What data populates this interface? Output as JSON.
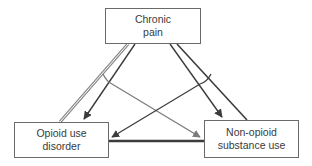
{
  "diagram": {
    "type": "triangle-relationship-diagram",
    "nodes": [
      {
        "id": "top",
        "label": "Chronic\npain"
      },
      {
        "id": "left",
        "label": "Opioid use\ndisorder"
      },
      {
        "id": "right",
        "label": "Non-opioid\nsubstance use"
      }
    ],
    "edges": [
      {
        "from": "top",
        "to": "left",
        "style": "double-line-gray",
        "arrow": false
      },
      {
        "from": "top",
        "to": "left",
        "style": "arrow-dark",
        "arrow": true
      },
      {
        "from": "top",
        "to": "right",
        "style": "arrow-dark",
        "arrow": true
      },
      {
        "from": "top",
        "to": "right",
        "style": "line-dark",
        "arrow": false
      },
      {
        "from": "top-left-branch",
        "to": "right",
        "style": "arrow-gray",
        "arrow": true
      },
      {
        "from": "top-right-branch",
        "to": "left",
        "style": "arrow-dark",
        "arrow": true
      },
      {
        "from": "left",
        "to": "right",
        "style": "thick-line-dark",
        "arrow": false
      }
    ],
    "colors": {
      "dark": "#3c3c3c",
      "gray": "#7a7a7a",
      "border": "#6a6a6a",
      "text": "#3a3a3a"
    }
  }
}
